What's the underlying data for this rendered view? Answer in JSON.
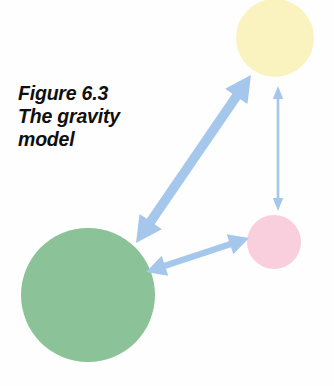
{
  "figure": {
    "caption_line_1": "Figure 6.3",
    "caption_line_2": "The gravity",
    "caption_line_3": "model",
    "background_color": "#fefefe"
  },
  "nodes": [
    {
      "id": "origin-large",
      "name": "green-circle",
      "color": "#8cc298",
      "cx": 88,
      "cy": 295,
      "r": 67
    },
    {
      "id": "destination-medium",
      "name": "yellow-circle",
      "color": "#fbf3bf",
      "cx": 275,
      "cy": 38,
      "r": 39
    },
    {
      "id": "destination-small",
      "name": "pink-circle",
      "color": "#f9cedd",
      "cx": 274,
      "cy": 242,
      "r": 27
    }
  ],
  "flows": [
    {
      "id": "flow-green-yellow",
      "name": "green-to-yellow-arrow",
      "color": "#a6c7ec",
      "weight": "thick",
      "x1": 136,
      "y1": 243,
      "x2": 251,
      "y2": 75
    },
    {
      "id": "flow-green-pink",
      "name": "green-to-pink-arrow",
      "color": "#a6c7ec",
      "weight": "medium",
      "x1": 146,
      "y1": 272,
      "x2": 249,
      "y2": 238
    },
    {
      "id": "flow-yellow-pink",
      "name": "yellow-to-pink-arrow",
      "color": "#a6c7ec",
      "weight": "thin",
      "x1": 278,
      "y1": 86,
      "x2": 278,
      "y2": 211
    }
  ]
}
